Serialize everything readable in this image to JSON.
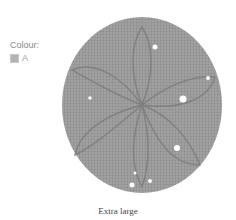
{
  "product": {
    "colour_label": "Colour:",
    "colours": [
      {
        "name": "A",
        "swatch_color": "#b4b4b4"
      }
    ],
    "image": {
      "subject": "knitted-beret",
      "yarn_color": "#9a9a9a"
    },
    "size_caption": "Extra large"
  }
}
